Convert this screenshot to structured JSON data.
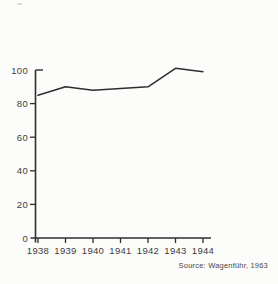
{
  "page": {
    "background_color": "#fcfcfb"
  },
  "chart_data": {
    "type": "line",
    "x": [
      "1938",
      "1939",
      "1940",
      "1941",
      "1942",
      "1943",
      "1944"
    ],
    "values": [
      85,
      90,
      88,
      89,
      90,
      101,
      99
    ],
    "series": [
      {
        "name": "production-index",
        "values": [
          85,
          90,
          88,
          89,
          90,
          101,
          99
        ]
      }
    ],
    "title": "",
    "xlabel": "",
    "ylabel": "",
    "yticks": [
      0,
      20,
      40,
      60,
      80,
      100
    ],
    "ylim": [
      0,
      100
    ],
    "grid": false,
    "legend_position": "none",
    "line_color": "#2e2e2e",
    "axis_color": "#2e2e2e",
    "label_color": "#3d3d3d",
    "source": "Source: Wagenführ, 1963"
  }
}
